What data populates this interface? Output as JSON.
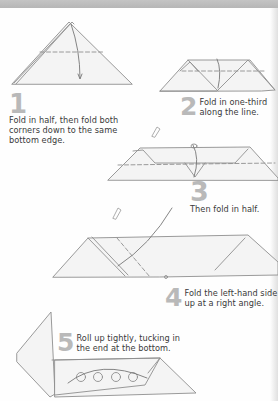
{
  "document": {
    "type": "origami instructions",
    "header_bar_color": "#bdbdbd",
    "number_color": "#b9b9b9",
    "text_color": "#3a3a3a",
    "line_color": "#8a8a8a",
    "paper_fill": "#f4f4f4"
  },
  "steps": [
    {
      "number": "1",
      "lines": [
        "Fold in half, then fold both",
        "corners down to the same",
        "bottom edge."
      ]
    },
    {
      "number": "2",
      "lines": [
        "Fold in one-third",
        "along the line."
      ]
    },
    {
      "number": "3",
      "lines": [
        "Then fold in half."
      ]
    },
    {
      "number": "4",
      "lines": [
        "Fold the left-hand side",
        "up at a right angle."
      ]
    },
    {
      "number": "5",
      "lines": [
        "Roll up tightly, tucking in",
        "the end at the bottom."
      ]
    }
  ],
  "icons": {
    "doodle": "pencil-doodle",
    "fold_arrow": "curved-arrow",
    "fold_line": "dashed-line"
  }
}
